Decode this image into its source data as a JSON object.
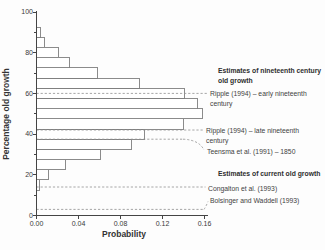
{
  "chart_data": {
    "type": "bar",
    "orientation": "horizontal",
    "xlabel": "Probability",
    "ylabel": "Percentage old growth",
    "xlim": [
      0,
      0.16
    ],
    "ylim": [
      0,
      100
    ],
    "xticks": [
      "0.00",
      "0.04",
      "0.08",
      "0.12",
      "0.16"
    ],
    "yticks": [
      "0",
      "20",
      "40",
      "60",
      "80",
      "100"
    ],
    "grid": "off",
    "bin_width_percent": 5,
    "bins": [
      {
        "center": 15,
        "p": 0.003
      },
      {
        "center": 20,
        "p": 0.011
      },
      {
        "center": 25,
        "p": 0.028
      },
      {
        "center": 30,
        "p": 0.061
      },
      {
        "center": 35,
        "p": 0.09
      },
      {
        "center": 40,
        "p": 0.103
      },
      {
        "center": 45,
        "p": 0.14
      },
      {
        "center": 50,
        "p": 0.158
      },
      {
        "center": 55,
        "p": 0.153
      },
      {
        "center": 60,
        "p": 0.141
      },
      {
        "center": 65,
        "p": 0.098
      },
      {
        "center": 70,
        "p": 0.058
      },
      {
        "center": 75,
        "p": 0.031
      },
      {
        "center": 80,
        "p": 0.021
      },
      {
        "center": 85,
        "p": 0.008
      },
      {
        "center": 90,
        "p": 0.004
      }
    ],
    "annotations": {
      "nineteenth_header_line1": "Estimates of nineteenth century",
      "nineteenth_header_line2": "old growth",
      "current_header": "Estimates of current old growth"
    },
    "estimates": [
      {
        "id": "ripple_early",
        "value": 60,
        "label_line1": "Ripple (1994) – early nineteenth",
        "label_line2": "century"
      },
      {
        "id": "ripple_late",
        "value": 42,
        "label_line1": "Ripple (1994) – late nineteenth",
        "label_line2": "century"
      },
      {
        "id": "teensma",
        "value": 37.5,
        "label_line1": "Teensma et al. (1991) – 1850",
        "label_line2": ""
      },
      {
        "id": "congalton",
        "value": 14,
        "label_line1": "Congalton et al. (1993)",
        "label_line2": ""
      },
      {
        "id": "bolsinger",
        "value": 3,
        "label_line1": "Bolsinger and Waddell (1993)",
        "label_line2": ""
      }
    ],
    "colors": {
      "bar_fill": "#ffffff",
      "bar_stroke": "#7e7e7e",
      "axis": "#444444",
      "dashed_line": "#8f8f8f",
      "text": "#3a3a3a"
    }
  }
}
